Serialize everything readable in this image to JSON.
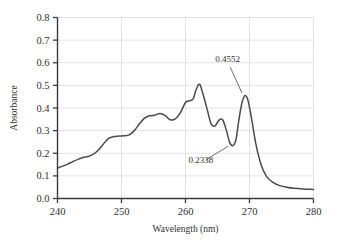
{
  "chart_data": {
    "type": "line",
    "title": "",
    "xlabel": "Wavelength (nm)",
    "ylabel": "Absorbance",
    "xlim": [
      240,
      280
    ],
    "ylim": [
      0.0,
      0.8
    ],
    "grid": true,
    "legend": "none",
    "xticks": [
      240,
      250,
      260,
      270,
      280
    ],
    "xtick_labels": [
      "240",
      "250",
      "260",
      "270",
      "280"
    ],
    "yticks": [
      0.0,
      0.1,
      0.2,
      0.3,
      0.4,
      0.5,
      0.6,
      0.7,
      0.8
    ],
    "ytick_labels": [
      "0.0",
      "0.1",
      "0.2",
      "0.3",
      "0.4",
      "0.5",
      "0.6",
      "0.7",
      "0.8"
    ],
    "series": [
      {
        "name": "absorbance-spectrum",
        "color": "#4a4a52",
        "x": [
          240.0,
          240.8,
          241.6,
          242.4,
          243.2,
          244.0,
          244.8,
          245.6,
          246.4,
          247.2,
          248.0,
          248.8,
          249.6,
          250.4,
          251.2,
          252.0,
          252.8,
          253.6,
          254.4,
          255.2,
          256.0,
          256.8,
          257.6,
          258.4,
          259.2,
          260.0,
          260.6,
          261.2,
          261.6,
          262.2,
          262.8,
          263.4,
          264.0,
          264.6,
          265.2,
          265.8,
          266.4,
          266.9,
          267.4,
          267.9,
          268.3,
          268.8,
          269.3,
          269.8,
          270.4,
          271.0,
          271.8,
          272.6,
          273.6,
          274.6,
          275.8,
          277.0,
          278.4,
          280.0
        ],
        "y": [
          0.135,
          0.143,
          0.152,
          0.163,
          0.173,
          0.181,
          0.186,
          0.196,
          0.214,
          0.242,
          0.266,
          0.274,
          0.276,
          0.277,
          0.281,
          0.3,
          0.33,
          0.355,
          0.366,
          0.368,
          0.376,
          0.367,
          0.348,
          0.352,
          0.38,
          0.424,
          0.432,
          0.44,
          0.476,
          0.505,
          0.455,
          0.392,
          0.33,
          0.32,
          0.345,
          0.348,
          0.3,
          0.248,
          0.234,
          0.262,
          0.34,
          0.42,
          0.455,
          0.43,
          0.34,
          0.24,
          0.15,
          0.1,
          0.072,
          0.058,
          0.05,
          0.045,
          0.042,
          0.04
        ]
      }
    ],
    "annotations": [
      {
        "name": "peak-annotation",
        "label": "0.4552",
        "value": 0.4552,
        "point_x": 269.0,
        "point_y": 0.455,
        "label_x": 266.6,
        "label_y": 0.605
      },
      {
        "name": "valley-annotation",
        "label": "0.2338",
        "value": 0.2338,
        "point_x": 267.1,
        "point_y": 0.238,
        "label_x": 262.4,
        "label_y": 0.158
      }
    ],
    "colors": {
      "curve": "#4a4a52",
      "axis": "#3a3a40",
      "grid": "#d8d8dd",
      "text": "#2f2f35",
      "annotation_leader": "#5a5a62",
      "background": "#ffffff"
    }
  }
}
